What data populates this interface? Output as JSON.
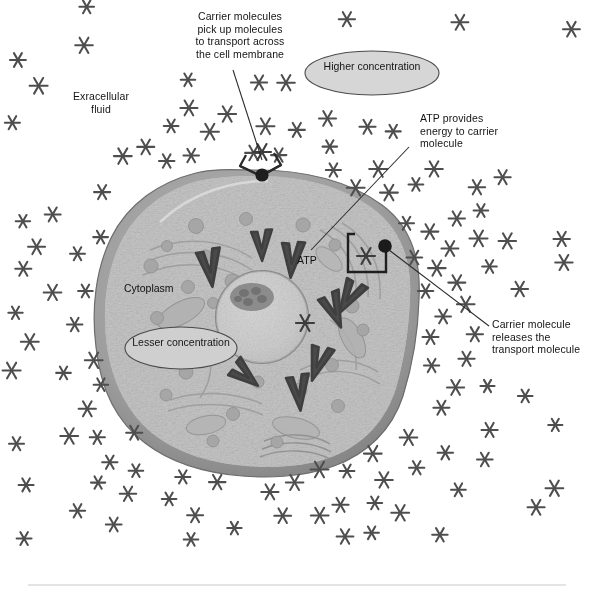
{
  "figure": {
    "background_color": "#ffffff",
    "rule_color": "#c9c9c9"
  },
  "annotations": [
    {
      "id": "carrier-pickup",
      "text": "Carrier molecules\npick up molecules\nto transport across\nthe cell membrane",
      "align": "center",
      "x": 170,
      "y": 10,
      "width": 140
    },
    {
      "id": "extracellular-fluid",
      "text": "Exracellular\nfluid",
      "align": "center",
      "x": 58,
      "y": 90,
      "width": 86
    },
    {
      "id": "atp-provides-energy",
      "text": "ATP provides\nenergy to carrier\nmolecule",
      "align": "left",
      "x": 420,
      "y": 112,
      "width": 120
    },
    {
      "id": "carrier-releases",
      "text": "Carrier molecule\nreleases the\ntransport molecule",
      "align": "left",
      "x": 492,
      "y": 318,
      "width": 104
    }
  ],
  "inline_labels": [
    {
      "id": "cytoplasm",
      "text": "Cytoplasm",
      "x": 124,
      "y": 282
    },
    {
      "id": "atp",
      "text": "ATP",
      "x": 297,
      "y": 254
    }
  ],
  "bubbles": [
    {
      "id": "higher-concentration",
      "text": "Higher\nconcentration",
      "cx": 372,
      "cy": 73,
      "rx": 67,
      "ry": 22,
      "fill": "#d6d6d6",
      "stroke": "#4a4a4a"
    },
    {
      "id": "lesser-concentration",
      "text": "Lesser\nconcentration",
      "cx": 181,
      "cy": 348,
      "rx": 56,
      "ry": 21,
      "fill": "#d0d0d0",
      "stroke": "#4a4a4a"
    }
  ],
  "cell": {
    "label": "animal cell",
    "center_x": 257,
    "center_y": 320,
    "radius_x": 152,
    "radius_y": 145,
    "membrane_color": "#6e6e6e",
    "membrane_outer_color": "#8f8f8f",
    "cytoplasm_fill": "#c3c3c3",
    "nucleus": {
      "cx": 262,
      "cy": 317,
      "r": 44,
      "fill": "#cfcfcf",
      "stroke": "#7d7d7d"
    },
    "nucleolus": {
      "cx": 253,
      "cy": 298,
      "rx": 21,
      "ry": 13,
      "fill": "#8a8a8a"
    }
  },
  "carriers": [
    {
      "id": "carrier-loading-top",
      "shape": "v-open",
      "anchor_x": 262,
      "anchor_y": 171,
      "note": "carrier picking up molecule at top of membrane"
    },
    {
      "id": "carrier-releasing-right",
      "shape": "bracket-open",
      "anchor_x": 385,
      "anchor_y": 246,
      "note": "carrier releasing molecule at right of membrane"
    }
  ],
  "leader_lines": [
    {
      "id": "leader-carrier-pickup",
      "x1": 233,
      "y1": 70,
      "x2": 262,
      "y2": 160
    },
    {
      "id": "leader-atp",
      "x1": 408,
      "y1": 147,
      "x2": 312,
      "y2": 250
    },
    {
      "id": "leader-carrier-releases",
      "x1": 388,
      "y1": 249,
      "x2": 489,
      "y2": 326
    },
    {
      "id": "leader-atp-bracket",
      "x1": 355,
      "y1": 235,
      "x2": 362,
      "y2": 268
    }
  ],
  "molecules": {
    "glyph": "asterisk",
    "color": "#4e4e4e",
    "size_px": 16,
    "outside_count": 118,
    "inside_count": 1,
    "description": "Six-pointed star glyphs representing transported solute molecules; dense outside the cell (higher concentration), sparse inside (lesser concentration)."
  },
  "vesicles": {
    "color": "#a5a5a5",
    "count": 22,
    "description": "Round gray organelles/vesicles scattered through the cytoplasm"
  },
  "internal_carriers": {
    "color": "#4a4a4a",
    "count": 8,
    "description": "Dark V-shaped (chevron) carrier molecules floating within the cytoplasm"
  },
  "footer_rule": {
    "x1": 28,
    "y1": 585,
    "x2": 566,
    "y2": 585
  }
}
